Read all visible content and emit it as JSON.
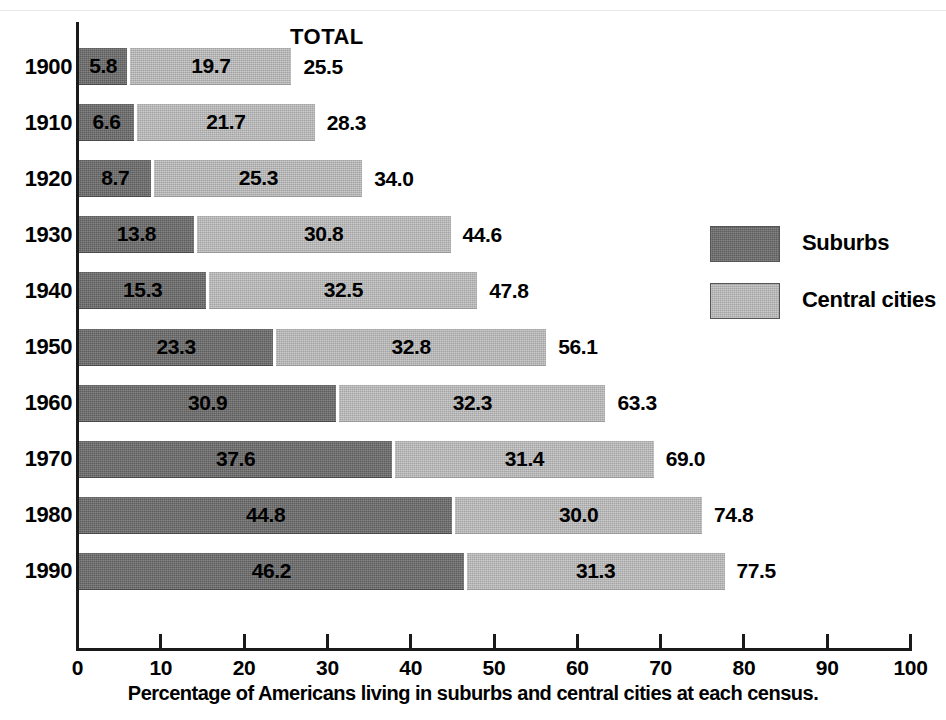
{
  "chart_data": {
    "type": "bar",
    "subtype": "stacked-horizontal",
    "title": "",
    "caption": "Percentage of Americans living in suburbs and central cities at each census.",
    "total_header": "TOTAL",
    "xlabel": "",
    "ylabel": "",
    "xlim": [
      0,
      100
    ],
    "grid": false,
    "legend_position": "right",
    "categories": [
      "1900",
      "1910",
      "1920",
      "1930",
      "1940",
      "1950",
      "1960",
      "1970",
      "1980",
      "1990"
    ],
    "series": [
      {
        "name": "Suburbs",
        "color": "#6e6e6e",
        "values": [
          5.8,
          6.6,
          8.7,
          13.8,
          15.3,
          23.3,
          30.9,
          37.6,
          44.8,
          46.2
        ]
      },
      {
        "name": "Central cities",
        "color": "#b7b7b7",
        "values": [
          19.7,
          21.7,
          25.3,
          30.8,
          32.5,
          32.8,
          32.3,
          31.4,
          30.0,
          31.3
        ]
      }
    ],
    "totals": [
      25.5,
      28.3,
      34.0,
      44.6,
      47.8,
      56.1,
      63.3,
      69.0,
      74.8,
      77.5
    ],
    "value_labels": {
      "suburbs": [
        "5.8",
        "6.6",
        "8.7",
        "13.8",
        "15.3",
        "23.3",
        "30.9",
        "37.6",
        "44.8",
        "46.2"
      ],
      "central_cities": [
        "19.7",
        "21.7",
        "25.3",
        "30.8",
        "32.5",
        "32.8",
        "32.3",
        "31.4",
        "30.0",
        "31.3"
      ],
      "totals": [
        "25.5",
        "28.3",
        "34.0",
        "44.6",
        "47.8",
        "56.1",
        "63.3",
        "69.0",
        "74.8",
        "77.5"
      ]
    },
    "xticks": [
      0,
      10,
      20,
      30,
      40,
      50,
      60,
      70,
      80,
      90,
      100
    ],
    "xtick_labels": [
      "0",
      "10",
      "20",
      "30",
      "40",
      "50",
      "60",
      "70",
      "80",
      "90",
      "100"
    ]
  },
  "legend": {
    "items": [
      {
        "label": "Suburbs",
        "color": "#6e6e6e"
      },
      {
        "label": "Central cities",
        "color": "#b7b7b7"
      }
    ]
  }
}
